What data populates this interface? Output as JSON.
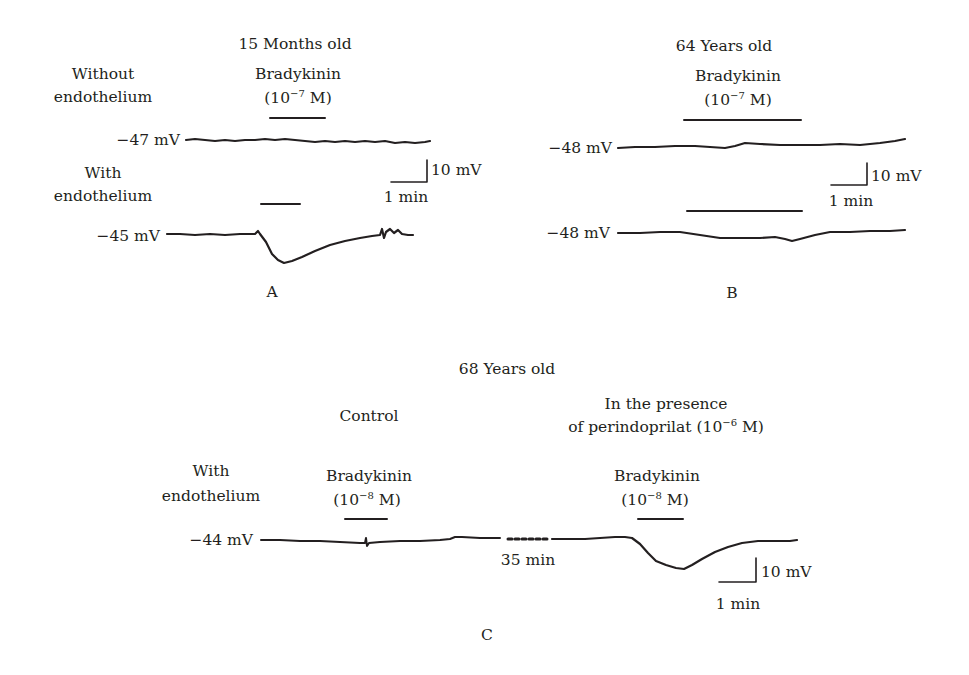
{
  "figure": {
    "panels": [
      {
        "id": "A",
        "panel_label": "A",
        "title": "15 Months old",
        "drug_label": "Bradykinin",
        "drug_conc_prefix": "(10",
        "drug_conc_exp": "−7",
        "drug_conc_suffix": " M)",
        "traces": [
          {
            "condition_line1": "Without",
            "condition_line2": "endothelium",
            "resting_potential": "−47 mV"
          },
          {
            "condition_line1": "With",
            "condition_line2": "endothelium",
            "resting_potential": "−45 mV"
          }
        ],
        "scale_bar": {
          "voltage": "10 mV",
          "time": "1 min"
        }
      },
      {
        "id": "B",
        "panel_label": "B",
        "title": "64 Years old",
        "drug_label": "Bradykinin",
        "drug_conc_prefix": "(10",
        "drug_conc_exp": "−7",
        "drug_conc_suffix": " M)",
        "traces": [
          {
            "resting_potential": "−48 mV"
          },
          {
            "resting_potential": "−48 mV"
          }
        ],
        "scale_bar": {
          "voltage": "10 mV",
          "time": "1 min"
        }
      },
      {
        "id": "C",
        "panel_label": "C",
        "title": "68 Years old",
        "condition_line1": "With",
        "condition_line2": "endothelium",
        "resting_potential": "−44 mV",
        "control_label": "Control",
        "treatment_line1": "In the presence",
        "treatment_line2_prefix": "of perindoprilat (10",
        "treatment_line2_exp": "−6",
        "treatment_line2_suffix": " M)",
        "drug_label": "Bradykinin",
        "drug_conc_prefix": "(10",
        "drug_conc_exp": "−8",
        "drug_conc_suffix": " M)",
        "gap_label": "35 min",
        "scale_bar": {
          "voltage": "10 mV",
          "time": "1 min"
        }
      }
    ],
    "colors": {
      "ink": "#231f20",
      "background": "#ffffff"
    }
  }
}
